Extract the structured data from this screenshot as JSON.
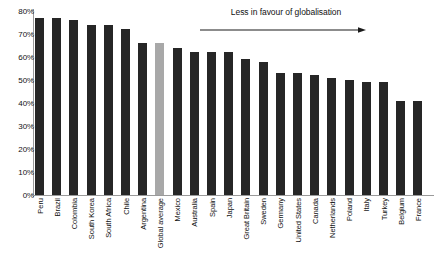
{
  "chart_data": {
    "type": "bar",
    "title": "",
    "subtitle": "",
    "xlabel": "",
    "ylabel": "",
    "ylim": [
      0,
      80
    ],
    "ytick_labels": [
      "0%",
      "10%",
      "20%",
      "30%",
      "40%",
      "50%",
      "60%",
      "70%",
      "80%"
    ],
    "ytick_values": [
      0,
      10,
      20,
      30,
      40,
      50,
      60,
      70,
      80
    ],
    "grid": false,
    "legend": "none",
    "categories": [
      "Peru",
      "Brazil",
      "Colombia",
      "South Korea",
      "South Africa",
      "Chile",
      "Argentina",
      "Global average",
      "Mexico",
      "Australia",
      "Spain",
      "Japan",
      "Great Britain",
      "Sweden",
      "Germany",
      "United States",
      "Canada",
      "Netherlands",
      "Poland",
      "Italy",
      "Turkey",
      "Belgium",
      "France"
    ],
    "values": [
      77,
      77,
      76,
      74,
      74,
      72,
      66,
      66,
      64,
      62,
      62,
      62,
      59,
      58,
      53,
      53,
      52,
      51,
      50,
      49,
      49,
      41,
      41
    ],
    "highlight_index": 7,
    "bar_color": "#262626",
    "highlight_color": "#a8a8a8",
    "annotations": [
      {
        "text": "Less in favour of globalisation",
        "arrow": "right"
      }
    ]
  },
  "annotation": {
    "label": "Less in favour of globalisation"
  }
}
